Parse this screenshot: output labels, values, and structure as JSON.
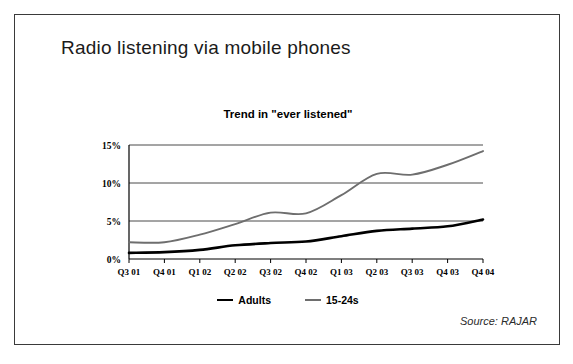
{
  "slide": {
    "main_title": "Radio listening via mobile phones",
    "source": "Source: RAJAR"
  },
  "legend": {
    "position": "bottom",
    "items": [
      {
        "label": "Adults",
        "color": "#000000"
      },
      {
        "label": "15-24s",
        "color": "#6e6e6e"
      }
    ]
  },
  "chart_data": {
    "type": "line",
    "title": "Trend in \"ever listened\"",
    "xlabel": "",
    "ylabel": "",
    "ylim": [
      0,
      15
    ],
    "yticks": [
      0,
      5,
      10,
      15
    ],
    "ytick_labels": [
      "0%",
      "5%",
      "10%",
      "15%"
    ],
    "grid": true,
    "legend_position": "bottom",
    "categories": [
      "Q3 01",
      "Q4 01",
      "Q1 02",
      "Q2 02",
      "Q3 02",
      "Q4 02",
      "Q1 03",
      "Q2 03",
      "Q3 03",
      "Q4 03",
      "Q4 04"
    ],
    "series": [
      {
        "name": "Adults",
        "color": "#000000",
        "values": [
          0.8,
          0.9,
          1.2,
          1.8,
          2.1,
          2.3,
          3.0,
          3.7,
          4.0,
          4.3,
          5.2
        ]
      },
      {
        "name": "15-24s",
        "color": "#6e6e6e",
        "values": [
          2.2,
          2.2,
          3.2,
          4.6,
          6.1,
          6.0,
          8.4,
          11.2,
          11.1,
          12.4,
          14.2
        ]
      }
    ]
  }
}
